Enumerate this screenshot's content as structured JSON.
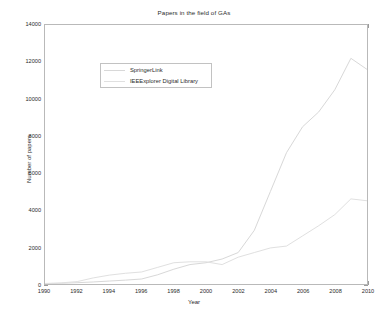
{
  "figure": {
    "title": "Papers in the field of GAs",
    "xlabel": "Year",
    "ylabel": "Number of papers"
  },
  "legend": {
    "items": [
      {
        "label": "SpringerLink",
        "color": "#d8d8d8"
      },
      {
        "label": "IEEExplorer Digital Library",
        "color": "#e0e0e0"
      }
    ]
  },
  "axes": {
    "x_ticks": [
      "1990",
      "1992",
      "1994",
      "1996",
      "1998",
      "2000",
      "2002",
      "2004",
      "2006",
      "2008",
      "2010"
    ],
    "y_ticks": [
      "0",
      "2000",
      "4000",
      "6000",
      "8000",
      "10000",
      "12000",
      "14000"
    ]
  },
  "chart_data": {
    "type": "line",
    "title": "Papers in the field of GAs",
    "xlabel": "Year",
    "ylabel": "Number of papers",
    "xlim": [
      1990,
      2010
    ],
    "ylim": [
      0,
      14000
    ],
    "x_ticks": [
      1990,
      1992,
      1994,
      1996,
      1998,
      2000,
      2002,
      2004,
      2006,
      2008,
      2010
    ],
    "y_ticks": [
      0,
      2000,
      4000,
      6000,
      8000,
      10000,
      12000,
      14000
    ],
    "grid": false,
    "legend_position": "upper-left-inset",
    "x": [
      1990,
      1991,
      1992,
      1993,
      1994,
      1995,
      1996,
      1997,
      1998,
      1999,
      2000,
      2001,
      2002,
      2003,
      2004,
      2005,
      2006,
      2007,
      2008,
      2009,
      2010
    ],
    "series": [
      {
        "name": "SpringerLink",
        "color": "#d8d8d8",
        "values": [
          20,
          40,
          70,
          110,
          160,
          210,
          270,
          500,
          800,
          1050,
          1150,
          1350,
          1700,
          2900,
          5000,
          7100,
          8500,
          9300,
          10500,
          12200,
          11600
        ]
      },
      {
        "name": "IEEExplorer Digital Library",
        "color": "#e0e0e0",
        "values": [
          30,
          60,
          130,
          330,
          480,
          580,
          650,
          900,
          1150,
          1200,
          1200,
          1050,
          1450,
          1700,
          1950,
          2050,
          2600,
          3150,
          3750,
          4600,
          4500
        ]
      }
    ]
  }
}
